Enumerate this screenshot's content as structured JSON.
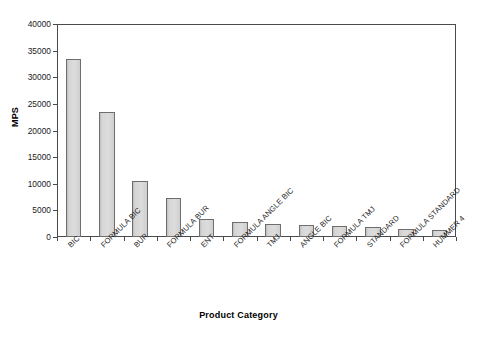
{
  "chart_data": {
    "type": "bar",
    "title": "",
    "xlabel": "Product Category",
    "ylabel": "MPS",
    "ylim": [
      0,
      40000
    ],
    "yticks": [
      0,
      5000,
      10000,
      15000,
      20000,
      25000,
      30000,
      35000,
      40000
    ],
    "ytick_labels": [
      "0",
      "5000",
      "10000",
      "15000",
      "20000",
      "25000",
      "30000",
      "35000",
      "40000"
    ],
    "grid": false,
    "legend": null,
    "categories": [
      "BIC",
      "FORMULA BIC",
      "BUR",
      "FORMULA BUR",
      "ENT",
      "FORMULA ANGLE BIC",
      "TMJ",
      "ANGLE BIC",
      "FORMULA TMJ",
      "STANDARD",
      "FORMULA STANDARD",
      "HUMMER 4"
    ],
    "values": [
      33500,
      23500,
      10500,
      7300,
      3400,
      2800,
      2400,
      2200,
      2100,
      1900,
      1500,
      1300
    ],
    "bar_fill_color": "#d6d6d6",
    "bar_border_color": "#6e6e6e",
    "axis_color": "#4a4a4a",
    "background_color": "#ffffff"
  }
}
